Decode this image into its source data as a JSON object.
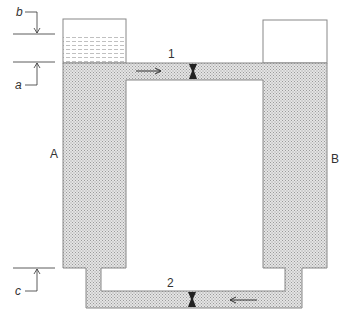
{
  "diagram": {
    "type": "connected-tanks-with-pipes",
    "tanks": [
      {
        "id": "A",
        "label": "A"
      },
      {
        "id": "B",
        "label": "B"
      }
    ],
    "pipes": [
      {
        "id": "1",
        "label": "1",
        "position": "top",
        "flow_direction": "A to B"
      },
      {
        "id": "2",
        "label": "2",
        "position": "bottom",
        "flow_direction": "B to A"
      }
    ],
    "dimensions": [
      {
        "id": "a",
        "label": "a"
      },
      {
        "id": "b",
        "label": "b"
      },
      {
        "id": "c",
        "label": "c"
      }
    ],
    "colors": {
      "fluid_fill": "#d4d4d4",
      "outline": "#888888",
      "valve": "#222222",
      "text": "#333333"
    }
  }
}
